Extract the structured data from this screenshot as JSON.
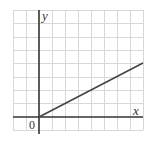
{
  "figure": {
    "x_axis_label": "x",
    "y_axis_label": "y",
    "origin_label": "0",
    "grid": {
      "columns": 10,
      "rows": 9,
      "cell_px": 13
    },
    "colors": {
      "grid": "#d8d8d8",
      "axis": "#333333",
      "line": "#444444"
    }
  },
  "line": {
    "from": [
      0,
      0
    ],
    "to": [
      8,
      4
    ],
    "slope": 0.5
  }
}
